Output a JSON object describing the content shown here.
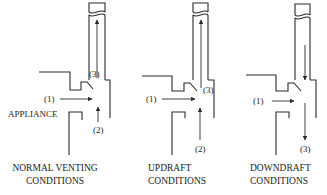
{
  "panels": [
    {
      "id": "normal",
      "caption_line1": "NORMAL VENTING",
      "caption_line2": "CONDITIONS",
      "label_1": "(1)",
      "label_2": "(2)",
      "label_3": "(3)",
      "appliance_label": "APPLIANCE"
    },
    {
      "id": "updraft",
      "caption_line1": "UPDRAFT",
      "caption_line2": "CONDITIONS",
      "label_1": "(1)",
      "label_2": "(2)",
      "label_3": "(3)"
    },
    {
      "id": "downdraft",
      "caption_line1": "DOWNDRAFT",
      "caption_line2": "CONDITIONS",
      "label_1": "(1)",
      "label_3": "(3)"
    }
  ]
}
